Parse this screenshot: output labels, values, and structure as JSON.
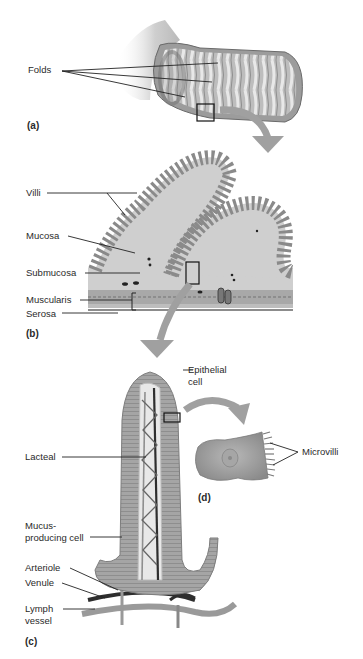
{
  "figure": {
    "panels": {
      "a": "(a)",
      "b": "(b)",
      "c": "(c)",
      "d": "(d)"
    },
    "labels": {
      "folds": "Folds",
      "villi": "Villi",
      "mucosa": "Mucosa",
      "submucosa": "Submucosa",
      "muscularis": "Muscularis",
      "serosa": "Serosa",
      "epithelial_1": "Epithelial",
      "epithelial_2": "cell",
      "lacteal": "Lacteal",
      "microvilli": "Microvilli",
      "mucus_1": "Mucus-",
      "mucus_2": "producing cell",
      "arteriole": "Arteriole",
      "venule": "Venule",
      "lymph_1": "Lymph",
      "lymph_2": "vessel"
    },
    "colors": {
      "tissue_dark": "#8a8a8a",
      "tissue_mid": "#a9a9a9",
      "tissue_light": "#d6d6d6",
      "arrow": "#a0a0a0",
      "line": "#222222"
    }
  }
}
